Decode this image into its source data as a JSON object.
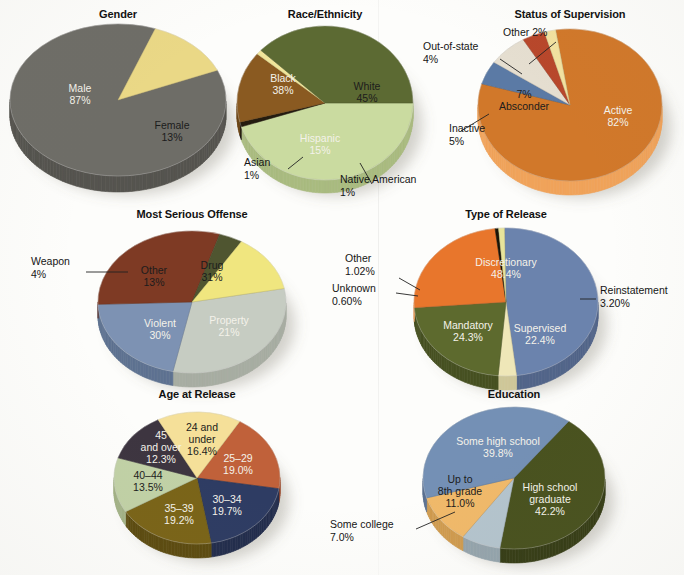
{
  "figure": {
    "background_color": "#fdfdfb"
  },
  "charts": [
    {
      "id": "gender",
      "title": "Gender",
      "type": "pie",
      "center_x": 118,
      "center_y": 100,
      "rx": 108,
      "ry": 76,
      "depth": 16,
      "start_angle": -23,
      "title_x": 118,
      "title_y": 8,
      "slices": [
        {
          "label": "Male",
          "value_label": "87%",
          "value": 87,
          "color": "#6e6d67",
          "side": "#55544f",
          "label_pos": "inside",
          "label_fill": "light",
          "lx": -38,
          "ly": -5,
          "label_lines": [
            "Male",
            "87%"
          ]
        },
        {
          "label": "Female",
          "value_label": "13%",
          "value": 13,
          "color": "#ead886",
          "side": "#c9b762",
          "label_pos": "inside",
          "label_fill": "dark",
          "lx": 54,
          "ly": 32,
          "label_lines": [
            "Female",
            "13%"
          ]
        }
      ],
      "callouts": []
    },
    {
      "id": "race-ethnicity",
      "title": "Race/Ethnicity",
      "type": "pie",
      "center_x": 325,
      "center_y": 103,
      "rx": 88,
      "ry": 77,
      "depth": 13,
      "start_angle": 0,
      "title_x": 325,
      "title_y": 8,
      "slices": [
        {
          "label": "White",
          "value_label": "45%",
          "value": 45,
          "color": "#cadba0",
          "side": "#a9bb80",
          "label_pos": "inside",
          "label_fill": "dark",
          "lx": 42,
          "ly": -10,
          "label_lines": [
            "White",
            "45%"
          ]
        },
        {
          "label": "Native American",
          "value_label": "1%",
          "value": 1,
          "color": "#241c10",
          "side": "#1a140c",
          "label_pos": "callout",
          "label_lines": [
            "Native American",
            "1%"
          ]
        },
        {
          "label": "Hispanic",
          "value_label": "15%",
          "value": 15,
          "color": "#8a5a21",
          "side": "#6d4618",
          "label_pos": "inside",
          "label_fill": "light",
          "lx": -5,
          "ly": 42,
          "label_lines": [
            "Hispanic",
            "15%"
          ]
        },
        {
          "label": "Asian",
          "value_label": "1%",
          "value": 1,
          "color": "#f0e59a",
          "side": "#cfc47f",
          "label_pos": "callout",
          "label_lines": [
            "Asian",
            "1%"
          ]
        },
        {
          "label": "Black",
          "value_label": "38%",
          "value": 38,
          "color": "#5c6a33",
          "side": "#475226",
          "label_pos": "inside",
          "label_fill": "light",
          "lx": -42,
          "ly": -18,
          "label_lines": [
            "Black",
            "38%"
          ]
        }
      ],
      "callouts": [
        {
          "for": "Asian",
          "text_lines": [
            "Asian",
            "1%"
          ],
          "tx": 244,
          "ty": 166,
          "anchor": "start",
          "line": [
            [
              288,
              169
            ],
            [
              303,
              157
            ]
          ]
        },
        {
          "for": "Native American",
          "text_lines": [
            "Native American",
            "1%"
          ],
          "tx": 340,
          "ty": 183,
          "anchor": "start",
          "line": [
            [
              372,
              184
            ],
            [
              360,
              163
            ]
          ]
        }
      ]
    },
    {
      "id": "status-of-supervision",
      "title": "Status of Supervision",
      "type": "pie",
      "center_x": 570,
      "center_y": 105,
      "rx": 92,
      "ry": 76,
      "depth": 14,
      "start_angle": -99,
      "title_x": 570,
      "title_y": 8,
      "slices": [
        {
          "label": "Active",
          "value_label": "82%",
          "value": 82,
          "color": "#d1782a",
          "side": "#f0a35a",
          "label_pos": "inside",
          "label_fill": "light",
          "lx": 48,
          "ly": 12,
          "label_lines": [
            "Active",
            "82%"
          ]
        },
        {
          "label": "Inactive",
          "value_label": "5%",
          "value": 5,
          "color": "#5b7aa5",
          "side": "#46618a",
          "label_pos": "callout",
          "label_lines": [
            "Inactive",
            "5%"
          ]
        },
        {
          "label": "Absconder",
          "value_label": "7%",
          "value": 7,
          "color": "#e5ded0",
          "side": "#c7bfae",
          "label_pos": "inside",
          "label_fill": "dark",
          "lx": -46,
          "ly": -4,
          "label_lines": [
            "7%",
            "Absconder"
          ]
        },
        {
          "label": "Out-of-state",
          "value_label": "4%",
          "value": 4,
          "color": "#b8472b",
          "side": "#93351f",
          "label_pos": "callout",
          "label_lines": [
            "Out-of-state",
            "4%"
          ]
        },
        {
          "label": "Other",
          "value_label": "2%",
          "value": 2,
          "color": "#f2e2a0",
          "side": "#d4c482",
          "label_pos": "callout",
          "label_lines": [
            "Other 2%"
          ]
        }
      ],
      "callouts": [
        {
          "for": "Other",
          "text_lines": [
            "Other 2%"
          ],
          "tx": 503,
          "ty": 36,
          "anchor": "start",
          "line": [
            [
              556,
              42
            ],
            [
              529,
              64
            ]
          ]
        },
        {
          "for": "Out-of-state",
          "text_lines": [
            "Out-of-state",
            "4%"
          ],
          "tx": 423,
          "ty": 50,
          "anchor": "start",
          "line": [
            [
              500,
              59
            ],
            [
              522,
              74
            ]
          ]
        },
        {
          "for": "Inactive",
          "text_lines": [
            "Inactive",
            "5%"
          ],
          "tx": 449,
          "ty": 132,
          "anchor": "start",
          "line": [
            [
              461,
              131
            ],
            [
              489,
              114
            ]
          ]
        }
      ]
    },
    {
      "id": "most-serious-offense",
      "title": "Most Serious Offense",
      "type": "pie",
      "center_x": 192,
      "center_y": 302,
      "rx": 94,
      "ry": 71,
      "depth": 14,
      "start_angle": -11,
      "title_x": 192,
      "title_y": 208,
      "slices": [
        {
          "label": "Drug",
          "value_label": "31%",
          "value": 31,
          "color": "#c6ccc2",
          "side": "#a7ada2",
          "label_pos": "inside",
          "label_fill": "dark",
          "lx": 20,
          "ly": -30,
          "label_lines": [
            "Drug",
            "31%"
          ]
        },
        {
          "label": "Property",
          "value_label": "21%",
          "value": 21,
          "color": "#7d92b3",
          "side": "#5e7291",
          "label_pos": "inside",
          "label_fill": "light",
          "lx": 37,
          "ly": 25,
          "label_lines": [
            "Property",
            "21%"
          ]
        },
        {
          "label": "Violent",
          "value_label": "30%",
          "value": 30,
          "color": "#7e3a24",
          "side": "#612919",
          "label_pos": "inside",
          "label_fill": "light",
          "lx": -32,
          "ly": 28,
          "label_lines": [
            "Violent",
            "30%"
          ]
        },
        {
          "label": "Weapon",
          "value_label": "4%",
          "value": 4,
          "color": "#4f5530",
          "side": "#3b4023",
          "label_pos": "callout",
          "label_lines": [
            "Weapon",
            "4%"
          ]
        },
        {
          "label": "Other",
          "value_label": "13%",
          "value": 13,
          "color": "#f0e67f",
          "side": "#d0c662",
          "label_pos": "inside",
          "label_fill": "dark",
          "lx": -38,
          "ly": -25,
          "label_lines": [
            "Other",
            "13%"
          ]
        }
      ],
      "callouts": [
        {
          "for": "Weapon",
          "text_lines": [
            "Weapon",
            "4%"
          ],
          "tx": 31,
          "ty": 265,
          "anchor": "start",
          "line": [
            [
              86,
              272
            ],
            [
              128,
              272
            ]
          ]
        }
      ]
    },
    {
      "id": "type-of-release",
      "title": "Type of Release",
      "type": "pie",
      "center_x": 506,
      "center_y": 302,
      "rx": 92,
      "ry": 74,
      "depth": 14,
      "start_angle": -91,
      "title_x": 506,
      "title_y": 208,
      "slices": [
        {
          "label": "Discretionary",
          "value_label": "48.4%",
          "value": 48.4,
          "color": "#6b83ad",
          "side": "#526589",
          "label_pos": "inside",
          "label_fill": "light",
          "lx": 0,
          "ly": -33,
          "label_lines": [
            "Discretionary",
            "48.4%"
          ]
        },
        {
          "label": "Reinstatement",
          "value_label": "3.20%",
          "value": 3.2,
          "color": "#efe7b8",
          "side": "#cfc799",
          "label_pos": "callout",
          "label_lines": [
            "Reinstatement",
            "3.20%"
          ]
        },
        {
          "label": "Supervised",
          "value_label": "22.4%",
          "value": 22.4,
          "color": "#5d6a2e",
          "side": "#475122",
          "label_pos": "inside",
          "label_fill": "light",
          "lx": 34,
          "ly": 33,
          "label_lines": [
            "Supervised",
            "22.4%"
          ]
        },
        {
          "label": "Mandatory",
          "value_label": "24.3%",
          "value": 24.3,
          "color": "#e8762c",
          "side": "#f0a364",
          "label_pos": "inside",
          "label_fill": "light",
          "lx": -38,
          "ly": 30,
          "label_lines": [
            "Mandatory",
            "24.3%"
          ]
        },
        {
          "label": "Unknown",
          "value_label": "0.60%",
          "value": 0.6,
          "color": "#191407",
          "side": "#120e05",
          "label_pos": "callout",
          "label_lines": [
            "Unknown",
            "0.60%"
          ]
        },
        {
          "label": "Other",
          "value_label": "1.02%",
          "value": 1.02,
          "color": "#e8e49a",
          "side": "#c9c57e",
          "label_pos": "callout",
          "label_lines": [
            "Other",
            "1.02%"
          ]
        }
      ],
      "callouts": [
        {
          "for": "Other",
          "text_lines": [
            "Other",
            "1.02%"
          ],
          "tx": 345,
          "ty": 262,
          "anchor": "start",
          "line": [
            [
              399,
              278
            ],
            [
              420,
              290
            ]
          ]
        },
        {
          "for": "Unknown",
          "text_lines": [
            "Unknown",
            "0.60%"
          ],
          "tx": 332,
          "ty": 292,
          "anchor": "start",
          "line": [
            [
              396,
              293
            ],
            [
              418,
              296
            ]
          ]
        },
        {
          "for": "Reinstatement",
          "text_lines": [
            "Reinstatement",
            "3.20%"
          ],
          "tx": 600,
          "ty": 294,
          "anchor": "start",
          "line": [
            [
              580,
              299
            ],
            [
              596,
              299
            ]
          ]
        }
      ]
    },
    {
      "id": "age-at-release",
      "title": "Age at Release",
      "type": "pie",
      "center_x": 197,
      "center_y": 478,
      "rx": 83,
      "ry": 66,
      "depth": 14,
      "start_angle": -59,
      "title_x": 197,
      "title_y": 388,
      "slices": [
        {
          "label": "25-29",
          "value_label": "19.0%",
          "value": 19.0,
          "color": "#c0613a",
          "side": "#9c4b2b",
          "label_pos": "inside",
          "label_fill": "light",
          "lx": 41,
          "ly": -13,
          "label_lines": [
            "25–29",
            "19.0%"
          ]
        },
        {
          "label": "30-34",
          "value_label": "19.7%",
          "value": 19.7,
          "color": "#2e3c63",
          "side": "#232e4d",
          "label_pos": "inside",
          "label_fill": "light",
          "lx": 30,
          "ly": 28,
          "label_lines": [
            "30–34",
            "19.7%"
          ]
        },
        {
          "label": "35-39",
          "value_label": "19.2%",
          "value": 19.2,
          "color": "#7a6418",
          "side": "#5d4c11",
          "label_pos": "inside",
          "label_fill": "light",
          "lx": -18,
          "ly": 37,
          "label_lines": [
            "35–39",
            "19.2%"
          ]
        },
        {
          "label": "40-44",
          "value_label": "13.5%",
          "value": 13.5,
          "color": "#c1d1a6",
          "side": "#a2b287",
          "label_pos": "inside",
          "label_fill": "dark",
          "lx": -49,
          "ly": 4,
          "label_lines": [
            "40–44",
            "13.5%"
          ]
        },
        {
          "label": "45 and over",
          "value_label": "12.3%",
          "value": 12.3,
          "color": "#3d3540",
          "side": "#2b252e",
          "label_pos": "inside",
          "label_fill": "light",
          "lx": -36,
          "ly": -30,
          "label_lines": [
            "45",
            "and over",
            "12.3%"
          ]
        },
        {
          "label": "24 and under",
          "value_label": "16.4%",
          "value": 16.4,
          "color": "#f5e099",
          "side": "#d6c27c",
          "label_pos": "inside",
          "label_fill": "dark",
          "lx": 5,
          "ly": -38,
          "label_lines": [
            "24 and",
            "under",
            "16.4%"
          ]
        }
      ],
      "callouts": []
    },
    {
      "id": "education",
      "title": "Education",
      "type": "pie",
      "center_x": 514,
      "center_y": 478,
      "rx": 91,
      "ry": 71,
      "depth": 14,
      "start_angle": -53,
      "title_x": 514,
      "title_y": 388,
      "slices": [
        {
          "label": "High school graduate",
          "value_label": "42.2%",
          "value": 42.2,
          "color": "#49521f",
          "side": "#373e17",
          "label_pos": "inside",
          "label_fill": "light",
          "lx": 36,
          "ly": 22,
          "label_lines": [
            "High school",
            "graduate",
            "42.2%"
          ]
        },
        {
          "label": "Some college",
          "value_label": "7.0%",
          "value": 7.0,
          "color": "#b4c4cd",
          "side": "#95a4ac",
          "label_pos": "callout",
          "label_lines": [
            "Some college",
            "7.0%"
          ]
        },
        {
          "label": "Up to 8th grade",
          "value_label": "11.0%",
          "value": 11.0,
          "color": "#f0b96a",
          "side": "#cf9b4f",
          "label_pos": "inside",
          "label_fill": "dark",
          "lx": -54,
          "ly": 14,
          "label_lines": [
            "Up to",
            "8th grade",
            "11.0%"
          ]
        },
        {
          "label": "Some high school",
          "value_label": "39.8%",
          "value": 39.8,
          "color": "#7490b5",
          "side": "#5a7191",
          "label_pos": "inside",
          "label_fill": "light",
          "lx": -16,
          "ly": -30,
          "label_lines": [
            "Some high school",
            "39.8%"
          ]
        }
      ],
      "callouts": [
        {
          "for": "Some college",
          "text_lines": [
            "Some college",
            "7.0%"
          ],
          "tx": 330,
          "ty": 528,
          "anchor": "start",
          "line": [
            [
              416,
              529
            ],
            [
              455,
              512
            ]
          ]
        }
      ]
    }
  ]
}
